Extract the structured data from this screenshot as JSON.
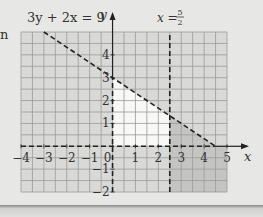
{
  "chart_data": {
    "type": "line",
    "title": "",
    "xlabel": "x",
    "ylabel": "y",
    "xlim": [
      -4,
      5
    ],
    "ylim": [
      -2,
      5
    ],
    "grid": true,
    "grid_step": 0.5,
    "x_ticks": [
      "-4",
      "-3",
      "-2",
      "-1",
      "0",
      "1",
      "2",
      "3",
      "4",
      "5"
    ],
    "y_ticks": [
      "-2",
      "-1",
      "1",
      "2",
      "3",
      "4"
    ],
    "series": [
      {
        "name": "3y + 2x = 9",
        "style": "dashed",
        "points": [
          [
            -3,
            5
          ],
          [
            4.5,
            0
          ]
        ]
      },
      {
        "name": "x = 5/2",
        "style": "dashed",
        "points": [
          [
            2.5,
            -2
          ],
          [
            2.5,
            5
          ]
        ]
      },
      {
        "name": "x = 0",
        "style": "dashed",
        "points": [
          [
            0,
            -2
          ],
          [
            0,
            3
          ]
        ]
      },
      {
        "name": "y = 0",
        "style": "dashed",
        "points": [
          [
            -4,
            0
          ],
          [
            4.5,
            0
          ]
        ]
      }
    ],
    "annotations": [
      {
        "text": "3y + 2x = 9",
        "position": "top-left"
      },
      {
        "text": "x = 5/2",
        "position": "top, above x=2.5"
      }
    ],
    "unshaded_region": {
      "description": "feasible region: x ≥ 0, y ≥ 0, x ≤ 5/2, 3y + 2x < 9",
      "vertices": [
        [
          0,
          0
        ],
        [
          2.5,
          0
        ],
        [
          2.5,
          1.333
        ],
        [
          0,
          3
        ]
      ]
    }
  },
  "labels": {
    "line_eq": "3y + 2x = 9",
    "vline_eq_lhs": "x = ",
    "vline_num": "5",
    "vline_den": "2",
    "x_axis": "x",
    "y_axis": "y",
    "margin_fragment": "n"
  },
  "colors": {
    "page": "#e7e7e5",
    "grid_bg": "#dcdcda",
    "grid_line": "#9a9a98",
    "shade_light": "#d9d9d7",
    "shade_dark": "#c4c4c2",
    "feasible": "#f8f8f6",
    "ink": "#222222"
  }
}
